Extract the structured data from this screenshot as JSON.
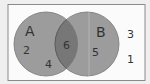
{
  "diagram": {
    "type": "venn",
    "sets": [
      {
        "label": "A",
        "only_value": "2",
        "only_value_2": "4"
      },
      {
        "label": "B",
        "only_value": "5"
      }
    ],
    "intersection_value": "6",
    "outside_values": [
      "3",
      "1"
    ],
    "colors": {
      "background": "#efefef",
      "universe_fill": "#fbfbfb",
      "universe_border": "#8a8a8a",
      "circle_fill": "#9c9c9c",
      "intersection_fill": "#777777"
    }
  }
}
